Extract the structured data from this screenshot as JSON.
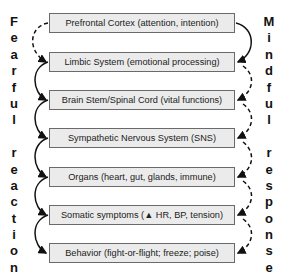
{
  "diagram": {
    "boxes": [
      {
        "label": "Prefrontal Cortex (attention, intention)"
      },
      {
        "label": "Limbic System (emotional processing)"
      },
      {
        "label": "Brain Stem/Spinal Cord (vital functions)"
      },
      {
        "label": "Sympathetic Nervous System (SNS)"
      },
      {
        "label": "Organs (heart, gut, glands, immune)"
      },
      {
        "label": "Somatic symptoms (▲ HR, BP, tension)"
      },
      {
        "label": "Behavior (fight-or-flight; freeze; poise)"
      }
    ],
    "left_label": {
      "letters": [
        "F",
        "e",
        "a",
        "r",
        "f",
        "u",
        "l",
        "",
        "r",
        "e",
        "a",
        "c",
        "t",
        "i",
        "o",
        "n"
      ],
      "text": "Fearful reaction"
    },
    "right_label": {
      "letters": [
        "M",
        "i",
        "n",
        "d",
        "f",
        "u",
        "l",
        "",
        "r",
        "e",
        "s",
        "p",
        "o",
        "n",
        "s",
        "e"
      ],
      "text": "Mindful response"
    },
    "colors": {
      "box_fill": "#ebebeb",
      "box_border": "#6a6a6a",
      "arrow": "#111111"
    }
  }
}
